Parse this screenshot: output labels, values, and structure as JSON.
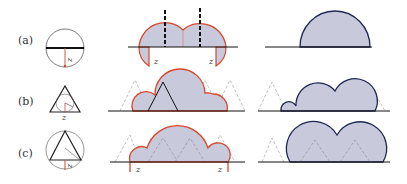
{
  "figure": {
    "rows": [
      {
        "label": "(a)",
        "shape": "circle",
        "left_marker": "z",
        "panel_labels": [
          "z",
          "z"
        ]
      },
      {
        "label": "(b)",
        "shape": "triangle",
        "left_marker": "z",
        "panel_labels": []
      },
      {
        "label": "(c)",
        "shape": "triangle-in-circle",
        "left_marker": "z",
        "panel_labels": [
          "z",
          "z"
        ]
      }
    ],
    "colors": {
      "boundary_red": "#d9472b",
      "boundary_navy": "#1e2752",
      "fill": "#c9c9dc",
      "axis": "#222222",
      "dashed": "#999999"
    }
  }
}
